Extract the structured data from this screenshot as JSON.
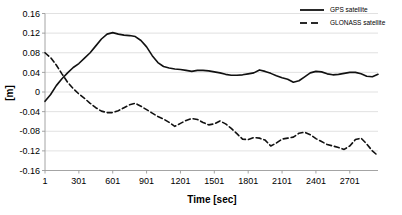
{
  "chart_data": {
    "type": "line",
    "title": "",
    "xlabel": "Time [sec]",
    "ylabel": "[m]",
    "xlim": [
      1,
      2951
    ],
    "ylim": [
      -0.16,
      0.16
    ],
    "grid": true,
    "legend_position": "top-right",
    "x_ticks": [
      "1",
      "301",
      "601",
      "901",
      "1201",
      "1501",
      "1801",
      "2101",
      "2401",
      "2701"
    ],
    "x_tick_values": [
      1,
      301,
      601,
      901,
      1201,
      1501,
      1801,
      2101,
      2401,
      2701
    ],
    "y_ticks": [
      "0.16",
      "0.12",
      "0.08",
      "0.04",
      "0",
      "-0.04",
      "-0.08",
      "-0.12",
      "-0.16"
    ],
    "y_tick_values": [
      0.16,
      0.12,
      0.08,
      0.04,
      0,
      -0.04,
      -0.08,
      -0.12,
      -0.16
    ],
    "x": [
      1,
      51,
      101,
      151,
      201,
      251,
      301,
      351,
      401,
      451,
      501,
      551,
      601,
      651,
      701,
      751,
      801,
      851,
      901,
      951,
      1001,
      1051,
      1101,
      1151,
      1201,
      1251,
      1301,
      1351,
      1401,
      1451,
      1501,
      1551,
      1601,
      1651,
      1701,
      1751,
      1801,
      1851,
      1901,
      1951,
      2001,
      2051,
      2101,
      2151,
      2201,
      2251,
      2301,
      2351,
      2401,
      2451,
      2501,
      2551,
      2601,
      2651,
      2701,
      2751,
      2801,
      2851,
      2901,
      2951
    ],
    "series": [
      {
        "name": "GPS satellite",
        "style": "solid",
        "color": "#111111",
        "values": [
          -0.019,
          -0.005,
          0.013,
          0.027,
          0.039,
          0.05,
          0.058,
          0.069,
          0.08,
          0.094,
          0.108,
          0.118,
          0.121,
          0.118,
          0.116,
          0.115,
          0.113,
          0.105,
          0.092,
          0.074,
          0.06,
          0.052,
          0.049,
          0.047,
          0.046,
          0.044,
          0.042,
          0.044,
          0.044,
          0.043,
          0.041,
          0.039,
          0.036,
          0.034,
          0.034,
          0.035,
          0.037,
          0.039,
          0.045,
          0.042,
          0.038,
          0.033,
          0.029,
          0.026,
          0.02,
          0.023,
          0.031,
          0.039,
          0.042,
          0.041,
          0.037,
          0.035,
          0.036,
          0.038,
          0.04,
          0.04,
          0.037,
          0.032,
          0.031,
          0.036
        ]
      },
      {
        "name": "GLONASS satellite",
        "style": "dashed",
        "color": "#111111",
        "values": [
          0.08,
          0.07,
          0.055,
          0.037,
          0.02,
          0.007,
          -0.004,
          -0.013,
          -0.023,
          -0.032,
          -0.039,
          -0.042,
          -0.042,
          -0.038,
          -0.032,
          -0.026,
          -0.023,
          -0.029,
          -0.036,
          -0.043,
          -0.05,
          -0.055,
          -0.062,
          -0.07,
          -0.064,
          -0.058,
          -0.054,
          -0.056,
          -0.062,
          -0.067,
          -0.065,
          -0.059,
          -0.065,
          -0.074,
          -0.085,
          -0.096,
          -0.097,
          -0.093,
          -0.094,
          -0.098,
          -0.11,
          -0.104,
          -0.096,
          -0.094,
          -0.092,
          -0.084,
          -0.082,
          -0.087,
          -0.095,
          -0.101,
          -0.107,
          -0.11,
          -0.113,
          -0.117,
          -0.11,
          -0.097,
          -0.094,
          -0.106,
          -0.12,
          -0.13
        ]
      }
    ]
  },
  "legend": {
    "items": [
      {
        "label": "GPS satellite",
        "style": "solid"
      },
      {
        "label": "GLONASS satellite",
        "style": "dashed"
      }
    ]
  }
}
